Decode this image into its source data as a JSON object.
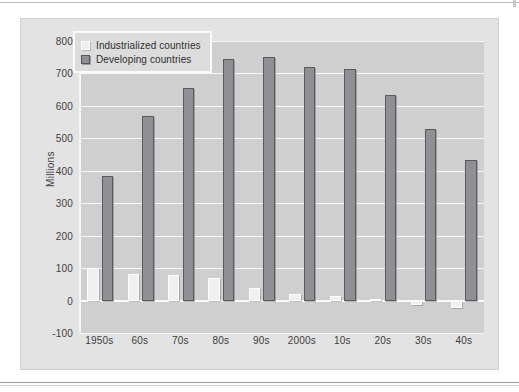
{
  "chart_data": {
    "type": "bar",
    "title": "",
    "xlabel": "",
    "ylabel": "Millions",
    "ylim": [
      -100,
      800
    ],
    "ytick_step": 100,
    "yticks": [
      "800",
      "700",
      "600",
      "500",
      "400",
      "300",
      "200",
      "100",
      "0",
      "-100"
    ],
    "grid": true,
    "legend_position": "top-left-inside",
    "categories": [
      "1950s",
      "60s",
      "70s",
      "80s",
      "90s",
      "2000s",
      "10s",
      "20s",
      "30s",
      "40s"
    ],
    "series": [
      {
        "name": "Industrialized countries",
        "color": "#f0f0f0",
        "values": [
          100,
          82,
          78,
          70,
          38,
          20,
          13,
          5,
          -15,
          -22
        ]
      },
      {
        "name": "Developing countries",
        "color": "#8f8f94",
        "values": [
          385,
          570,
          655,
          745,
          750,
          720,
          715,
          635,
          528,
          432
        ]
      }
    ]
  },
  "legend": {
    "items": [
      {
        "label": "Industrialized countries",
        "swatch": "legend-swatch-industrialized"
      },
      {
        "label": "Developing countries",
        "swatch": "legend-swatch-developing"
      }
    ]
  },
  "axis": {
    "y_title": "Millions"
  }
}
